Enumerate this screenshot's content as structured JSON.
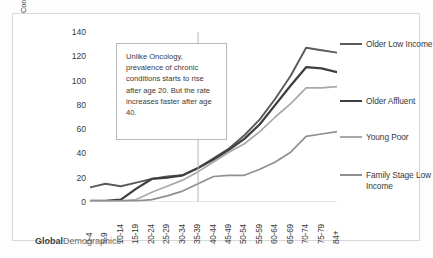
{
  "brand": {
    "bold_part": "Global",
    "light_part": "Demographics"
  },
  "axis": {
    "y_title_line1": "Total Prevalance for 5 Chronic",
    "y_title_line2": "Conditions by Age and Country Segment"
  },
  "annotation": {
    "text": "Unlike Oncology, prevalence of chronic conditions starts to rise after age 20.  But the rate increases faster after age 40."
  },
  "chart_data": {
    "type": "line",
    "title": "",
    "xlabel": "",
    "ylabel": "Total Prevalance for 5 Chronic Conditions by Age and Country Segment",
    "ylim": [
      0,
      140
    ],
    "yticks": [
      0,
      20,
      40,
      60,
      80,
      100,
      120,
      140
    ],
    "grid": false,
    "legend_position": "right",
    "reference_line_x": "35-39",
    "categories": [
      "0-4",
      "5-9",
      "10-14",
      "15-19",
      "20-24",
      "25-29",
      "30-34",
      "35-39",
      "40-44",
      "45-49",
      "50-54",
      "55-59",
      "60-64",
      "65-69",
      "70-74",
      "75-79",
      "84+"
    ],
    "series": [
      {
        "name": "Older Low Income",
        "color": "#5a5a5a",
        "values": [
          12,
          15,
          13,
          16,
          19,
          21,
          22,
          28,
          36,
          44,
          55,
          68,
          85,
          104,
          127,
          125,
          123
        ]
      },
      {
        "name": "Older Affluent",
        "color": "#3f3f3f",
        "values": [
          1,
          1,
          2,
          11,
          19,
          20,
          22,
          28,
          35,
          43,
          52,
          64,
          80,
          96,
          111,
          110,
          107
        ]
      },
      {
        "name": "Young Poor",
        "color": "#a8a8a8",
        "values": [
          1,
          1,
          1,
          2,
          8,
          13,
          18,
          25,
          33,
          41,
          48,
          58,
          70,
          81,
          94,
          94,
          95
        ]
      },
      {
        "name": "Family Stage Low Income",
        "color": "#8f8f8f",
        "values": [
          1,
          1,
          1,
          1,
          2,
          5,
          9,
          15,
          21,
          22,
          22,
          27,
          33,
          41,
          54,
          56,
          58
        ]
      }
    ]
  }
}
